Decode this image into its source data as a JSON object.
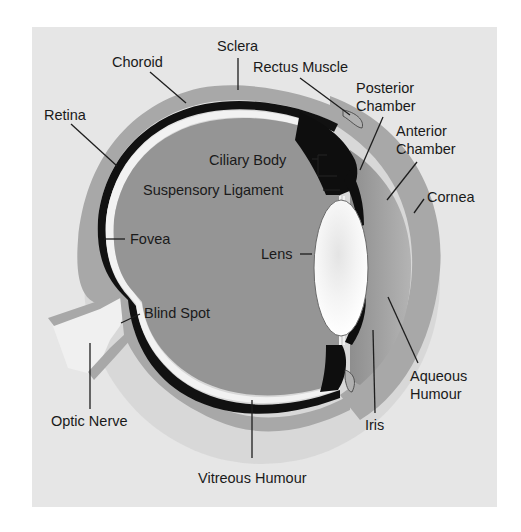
{
  "diagram": {
    "colors": {
      "page_bg": "#ffffff",
      "panel_bg": "#e6e6e6",
      "sclera": "#a8a8a8",
      "choroid": "#111111",
      "retina": "#f2f2f2",
      "vitreous": "#959595",
      "lens": "#f5f5f5",
      "aqueous": "#a0a0a0",
      "text": "#1a1a1a"
    },
    "labels": {
      "sclera": "Sclera",
      "choroid": "Choroid",
      "rectus_muscle": "Rectus Muscle",
      "posterior_chamber_1": "Posterior",
      "posterior_chamber_2": "Chamber",
      "anterior_chamber_1": "Anterior",
      "anterior_chamber_2": "Chamber",
      "retina": "Retina",
      "ciliary_body": "Ciliary Body",
      "suspensory_ligament": "Suspensory Ligament",
      "cornea": "Cornea",
      "fovea": "Fovea",
      "lens": "Lens",
      "blind_spot": "Blind Spot",
      "aqueous_humour_1": "Aqueous",
      "aqueous_humour_2": "Humour",
      "optic_nerve": "Optic Nerve",
      "iris": "Iris",
      "vitreous_humour": "Vitreous Humour"
    }
  }
}
